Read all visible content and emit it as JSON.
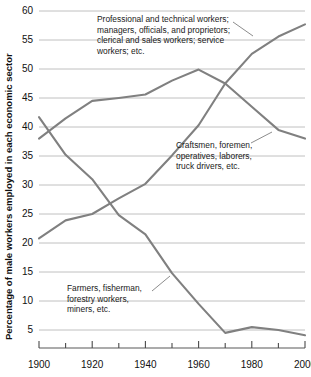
{
  "chart_data": {
    "type": "line",
    "title": "",
    "xlabel": "",
    "ylabel": "Percentage of male workers employed in each economic sector",
    "xlim": [
      1900,
      2000
    ],
    "ylim": [
      5,
      60
    ],
    "grid": true,
    "legend_position": "annotations-on-plot",
    "x": [
      1900,
      1910,
      1920,
      1930,
      1940,
      1950,
      1960,
      1970,
      1980,
      1990,
      2000
    ],
    "x_tick_labels": [
      "1900",
      "1920",
      "1940",
      "1960",
      "1980",
      "2000"
    ],
    "x_major_ticks": [
      1900,
      1920,
      1940,
      1960,
      1980,
      2000
    ],
    "x_minor_ticks": [
      1910,
      1930,
      1950,
      1970,
      1990
    ],
    "y_tick_labels": [
      "60",
      "55",
      "50",
      "45",
      "40",
      "35",
      "30",
      "25",
      "20",
      "15",
      "10",
      "5"
    ],
    "y_ticks": [
      60,
      55,
      50,
      45,
      40,
      35,
      30,
      25,
      20,
      15,
      10,
      5
    ],
    "series": [
      {
        "name": "Professional and technical workers; managers, officials, and proprietors; clerical and sales workers; service workers; etc.",
        "short_name": "professional-service",
        "color": "#808080",
        "values": [
          20.8,
          23.9,
          25.0,
          27.7,
          30.2,
          35.1,
          40.3,
          47.5,
          52.6,
          55.6,
          57.7
        ]
      },
      {
        "name": "Craftsmen, foremen, operatives, laborers, truck drivers, etc.",
        "short_name": "craftsmen-operatives",
        "color": "#808080",
        "values": [
          38.0,
          41.5,
          44.5,
          45.0,
          45.6,
          48.0,
          49.9,
          47.5,
          43.5,
          39.5,
          38.0
        ]
      },
      {
        "name": "Farmers, fisherman, forestry workers, miners, etc.",
        "short_name": "farmers-miners",
        "color": "#808080",
        "values": [
          41.7,
          35.2,
          31.0,
          24.8,
          21.5,
          14.8,
          9.5,
          4.5,
          5.5,
          5.0,
          4.1
        ]
      }
    ],
    "annotations": [
      {
        "id": "annotation-professional",
        "lines": [
          "Professional and technical workers;",
          "managers, officials, and proprietors;",
          "clerical and sales workers; service",
          "workers; etc."
        ]
      },
      {
        "id": "annotation-craftsmen",
        "lines": [
          "Craftsmen, foremen,",
          "operatives, laborers,",
          "truck drivers, etc."
        ]
      },
      {
        "id": "annotation-farmers",
        "lines": [
          "Farmers, fisherman,",
          "forestry workers,",
          "miners, etc."
        ]
      }
    ],
    "colors": {
      "line": "#808080",
      "grid": "#b9b9b9",
      "axis": "#8f8f8f",
      "text": "#111111",
      "background": "#ffffff"
    }
  }
}
